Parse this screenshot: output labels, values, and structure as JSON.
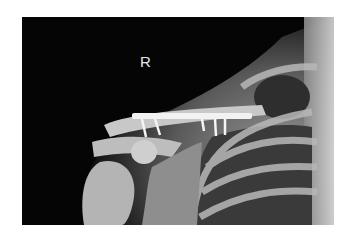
{
  "image": {
    "type": "radiograph",
    "view": "right shoulder / clavicle AP",
    "side_marker": "R",
    "colors": {
      "background": "#050505",
      "bone": "#bdbdbd",
      "hardware": "#f2f2f2",
      "page": "#ffffff"
    },
    "hardware": {
      "plate": "clavicle plate",
      "visible_screws": 5
    }
  }
}
